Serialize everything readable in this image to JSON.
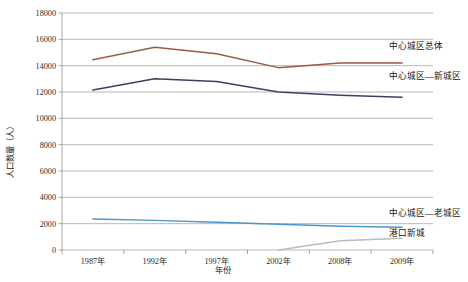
{
  "chart_data": {
    "type": "line",
    "title": "",
    "xlabel": "年份",
    "ylabel": "人口数量（人）",
    "categories": [
      "1987年",
      "1992年",
      "1997年",
      "2002年",
      "2008年",
      "2009年"
    ],
    "ylim": [
      0,
      18000
    ],
    "ytick_labels": [
      "0",
      "2000",
      "4000",
      "6000",
      "8000",
      "10000",
      "12000",
      "14000",
      "16000",
      "18000"
    ],
    "ytick_values": [
      0,
      2000,
      4000,
      6000,
      8000,
      10000,
      12000,
      14000,
      16000,
      18000
    ],
    "grid": true,
    "legend_position": "right-inline",
    "series": [
      {
        "name": "中心城区总体",
        "color": "#9c5a43",
        "values": [
          14450,
          15400,
          14900,
          13850,
          14200,
          14200
        ]
      },
      {
        "name": "中心城区—新城区",
        "color": "#3b3f66",
        "values": [
          12150,
          13000,
          12800,
          12000,
          11750,
          11600
        ]
      },
      {
        "name": "中心城区—老城区",
        "color": "#4a96cf",
        "values": [
          2350,
          2250,
          2100,
          1950,
          1800,
          1720
        ]
      },
      {
        "name": "港口新城",
        "color": "#b9bdb4",
        "values": [
          null,
          null,
          null,
          0,
          700,
          900
        ]
      }
    ]
  },
  "legend": {
    "items": [
      {
        "label": "中心城区总体"
      },
      {
        "label": "中心城区—新城区"
      },
      {
        "label": "中心城区—老城区"
      },
      {
        "label": "港口新城"
      }
    ]
  }
}
